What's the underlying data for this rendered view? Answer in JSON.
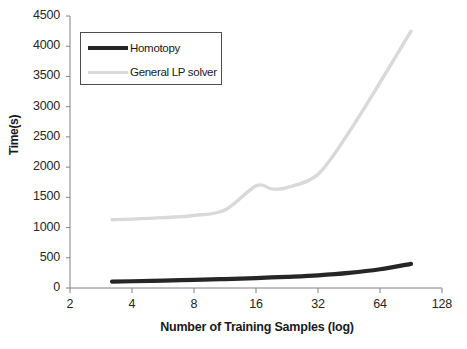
{
  "chart_data": {
    "type": "line",
    "title": "",
    "xlabel": "Number of Training  Samples (log)",
    "ylabel": "Time(s)",
    "xscale": "log2",
    "xlim": [
      2,
      128
    ],
    "ylim": [
      0,
      4500
    ],
    "xticks": [
      2,
      4,
      8,
      16,
      32,
      64,
      128
    ],
    "xtick_labels": [
      "2",
      "4",
      "8",
      "16",
      "32",
      "64",
      "128"
    ],
    "yticks": [
      0,
      500,
      1000,
      1500,
      2000,
      2500,
      3000,
      3500,
      4000,
      4500
    ],
    "ytick_labels": [
      "0",
      "500",
      "1000",
      "1500",
      "2000",
      "2500",
      "3000",
      "3500",
      "4000",
      "4500"
    ],
    "grid": false,
    "legend_position": "upper left",
    "series": [
      {
        "name": "Homotopy",
        "color": "#262626",
        "x": [
          3.2,
          4,
          5.7,
          8,
          11.3,
          16,
          22.6,
          32,
          45.3,
          64,
          90.5
        ],
        "values": [
          105,
          112,
          122,
          135,
          148,
          165,
          185,
          210,
          250,
          310,
          400
        ]
      },
      {
        "name": "General LP solver",
        "color": "#d9d9d9",
        "x": [
          3.2,
          4,
          5.7,
          8,
          11.3,
          16,
          19,
          22.6,
          32,
          45.3,
          64,
          90.5
        ],
        "values": [
          1130,
          1140,
          1165,
          1200,
          1290,
          1690,
          1640,
          1660,
          1880,
          2580,
          3400,
          4250
        ]
      }
    ]
  },
  "legend": {
    "entries": [
      {
        "label": "Homotopy",
        "color": "#262626"
      },
      {
        "label": "General LP solver",
        "color": "#d9d9d9"
      }
    ]
  },
  "axes": {
    "axis_color": "#808080",
    "tick_color": "#808080"
  }
}
